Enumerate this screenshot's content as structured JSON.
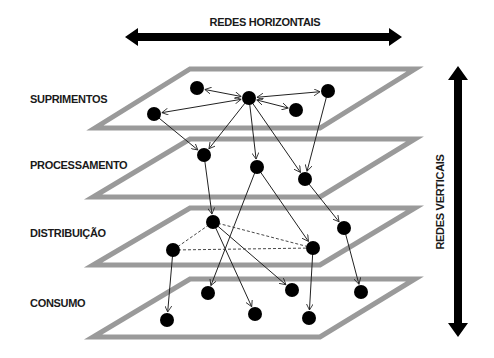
{
  "title_horizontal": "REDES HORIZONTAIS",
  "title_vertical": "REDES VERTICAIS",
  "colors": {
    "plane": "#9a9a9a",
    "node": "#000000",
    "arrow": "#000000",
    "edge": "#222222",
    "background": "#ffffff"
  },
  "layers": [
    {
      "id": "suprimentos",
      "label": "SUPRIMENTOS"
    },
    {
      "id": "processamento",
      "label": "PROCESSAMENTO"
    },
    {
      "id": "distribuicao",
      "label": "DISTRIBUIÇÃO"
    },
    {
      "id": "consumo",
      "label": "CONSUMO"
    }
  ],
  "nodes": [
    {
      "id": "A",
      "layer": "suprimentos",
      "x": 197,
      "y": 88
    },
    {
      "id": "B",
      "layer": "suprimentos",
      "x": 249,
      "y": 98
    },
    {
      "id": "C",
      "layer": "suprimentos",
      "x": 328,
      "y": 91
    },
    {
      "id": "D",
      "layer": "suprimentos",
      "x": 296,
      "y": 110
    },
    {
      "id": "E",
      "layer": "suprimentos",
      "x": 154,
      "y": 114
    },
    {
      "id": "F",
      "layer": "processamento",
      "x": 204,
      "y": 155
    },
    {
      "id": "G",
      "layer": "processamento",
      "x": 257,
      "y": 167
    },
    {
      "id": "H",
      "layer": "processamento",
      "x": 305,
      "y": 179
    },
    {
      "id": "I",
      "layer": "distribuicao",
      "x": 213,
      "y": 222
    },
    {
      "id": "J",
      "layer": "distribuicao",
      "x": 173,
      "y": 250
    },
    {
      "id": "K",
      "layer": "distribuicao",
      "x": 313,
      "y": 248
    },
    {
      "id": "L",
      "layer": "distribuicao",
      "x": 344,
      "y": 228
    },
    {
      "id": "M",
      "layer": "consumo",
      "x": 208,
      "y": 293
    },
    {
      "id": "N",
      "layer": "consumo",
      "x": 292,
      "y": 290
    },
    {
      "id": "O",
      "layer": "consumo",
      "x": 361,
      "y": 292
    },
    {
      "id": "P",
      "layer": "consumo",
      "x": 167,
      "y": 320
    },
    {
      "id": "Q",
      "layer": "consumo",
      "x": 255,
      "y": 314
    },
    {
      "id": "R",
      "layer": "consumo",
      "x": 309,
      "y": 318
    }
  ],
  "edges": [
    {
      "from": "B",
      "to": "A",
      "type": "bidirectional"
    },
    {
      "from": "B",
      "to": "C",
      "type": "bidirectional"
    },
    {
      "from": "B",
      "to": "D",
      "type": "bidirectional"
    },
    {
      "from": "B",
      "to": "E",
      "type": "bidirectional"
    },
    {
      "from": "E",
      "to": "F",
      "type": "directed"
    },
    {
      "from": "B",
      "to": "F",
      "type": "directed"
    },
    {
      "from": "B",
      "to": "G",
      "type": "directed"
    },
    {
      "from": "B",
      "to": "H",
      "type": "directed"
    },
    {
      "from": "C",
      "to": "H",
      "type": "directed"
    },
    {
      "from": "F",
      "to": "I",
      "type": "directed"
    },
    {
      "from": "G",
      "to": "K",
      "type": "directed"
    },
    {
      "from": "G",
      "to": "M",
      "type": "directed"
    },
    {
      "from": "H",
      "to": "L",
      "type": "directed"
    },
    {
      "from": "I",
      "to": "J",
      "type": "dashed"
    },
    {
      "from": "I",
      "to": "K",
      "type": "dashed"
    },
    {
      "from": "J",
      "to": "K",
      "type": "dashed"
    },
    {
      "from": "J",
      "to": "P",
      "type": "directed"
    },
    {
      "from": "I",
      "to": "Q",
      "type": "directed"
    },
    {
      "from": "I",
      "to": "N",
      "type": "directed"
    },
    {
      "from": "K",
      "to": "R",
      "type": "directed"
    },
    {
      "from": "L",
      "to": "O",
      "type": "directed"
    }
  ]
}
